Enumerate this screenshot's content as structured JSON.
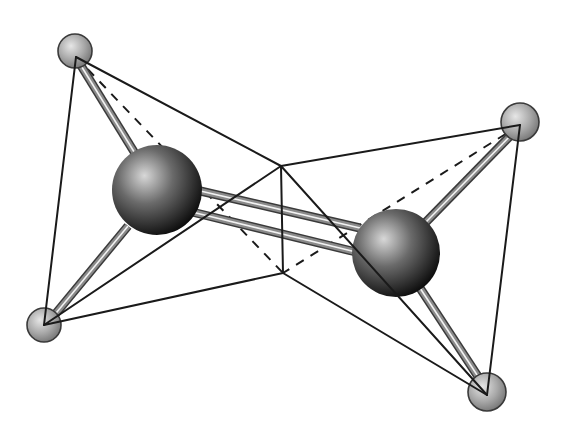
{
  "diagram": {
    "type": "ball-and-stick-molecule",
    "width": 566,
    "height": 436,
    "background": "#ffffff",
    "colors": {
      "edge_line": "#1a1a1a",
      "bond_dark": "#3a3a3a",
      "bond_mid": "#8a8a8a",
      "bond_highlight": "#f2f2f2",
      "large_atom_light": "#d8d8d8",
      "large_atom_mid": "#6a6a6a",
      "large_atom_dark": "#0c0c0c",
      "small_atom_light": "#e6e6e6",
      "small_atom_mid": "#a8a8a8",
      "small_atom_dark": "#6e6e6e",
      "small_atom_outline": "#3a3a3a"
    },
    "large_atoms": [
      {
        "id": "large-atom-left",
        "cx": 157,
        "cy": 190,
        "r": 45
      },
      {
        "id": "large-atom-right",
        "cx": 396,
        "cy": 253,
        "r": 44
      }
    ],
    "small_atoms": [
      {
        "id": "small-atom-top-left",
        "cx": 75,
        "cy": 51,
        "r": 17
      },
      {
        "id": "small-atom-top-right",
        "cx": 520,
        "cy": 122,
        "r": 19
      },
      {
        "id": "small-atom-bottom-left",
        "cx": 44,
        "cy": 325,
        "r": 17
      },
      {
        "id": "small-atom-bottom-right",
        "cx": 487,
        "cy": 392,
        "r": 19
      }
    ],
    "bonds": [
      {
        "id": "bond-left-top-left",
        "x1": 80,
        "y1": 64,
        "x2": 136,
        "y2": 155,
        "w": 9
      },
      {
        "id": "bond-left-bottom-left",
        "x1": 52,
        "y1": 318,
        "x2": 128,
        "y2": 226,
        "w": 9
      },
      {
        "id": "bond-right-top-right",
        "x1": 512,
        "y1": 134,
        "x2": 426,
        "y2": 222,
        "w": 9
      },
      {
        "id": "bond-right-bottom-right",
        "x1": 481,
        "y1": 381,
        "x2": 420,
        "y2": 288,
        "w": 9
      },
      {
        "id": "bond-double-upper",
        "x1": 196,
        "y1": 190,
        "x2": 360,
        "y2": 228,
        "w": 9
      },
      {
        "id": "bond-double-lower",
        "x1": 192,
        "y1": 212,
        "x2": 356,
        "y2": 252,
        "w": 9
      }
    ],
    "vertices": {
      "top_left": [
        76,
        57
      ],
      "top_right": [
        520,
        125
      ],
      "bottom_left": [
        44,
        325
      ],
      "bottom_right": [
        487,
        395
      ],
      "center_top": [
        281,
        166
      ],
      "center_bottom": [
        283,
        273
      ]
    },
    "solid_edges": [
      {
        "id": "edge-tl-bl",
        "from": "top_left",
        "to": "bottom_left"
      },
      {
        "id": "edge-tl-ct",
        "from": "top_left",
        "to": "center_top"
      },
      {
        "id": "edge-ct-bl",
        "from": "center_top",
        "to": "bottom_left"
      },
      {
        "id": "edge-bl-cb",
        "from": "bottom_left",
        "to": "center_bottom"
      },
      {
        "id": "edge-ct-cb",
        "from": "center_top",
        "to": "center_bottom"
      },
      {
        "id": "edge-ct-tr",
        "from": "center_top",
        "to": "top_right"
      },
      {
        "id": "edge-ct-br",
        "from": "center_top",
        "to": "bottom_right"
      },
      {
        "id": "edge-tr-br",
        "from": "top_right",
        "to": "bottom_right"
      },
      {
        "id": "edge-cb-br",
        "from": "center_bottom",
        "to": "bottom_right"
      }
    ],
    "dashed_edges": [
      {
        "id": "dash-tl-cb",
        "from": "top_left",
        "to": "center_bottom"
      },
      {
        "id": "dash-tr-cb",
        "from": "top_right",
        "to": "center_bottom"
      }
    ]
  }
}
